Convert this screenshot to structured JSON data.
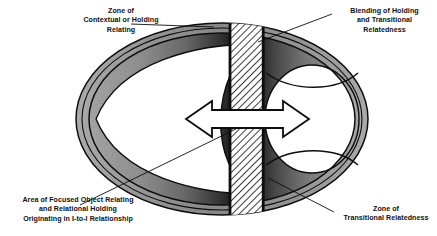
{
  "figure": {
    "type": "diagram",
    "labels": {
      "zone_contextual": {
        "name": "Zone of Contextual or Holding Relating",
        "lines": [
          "Zone of",
          "Contextual or Holding",
          "Relating"
        ],
        "align": "center"
      },
      "blending": {
        "name": "Blending of Holding and Transitional Relatedness",
        "lines": [
          "Blending of Holding",
          "and Transitional",
          "Relatedness"
        ],
        "align": "center"
      },
      "focused_object": {
        "name": "Area of Focused Object Relating and Relational Holding Originating in I-to-I Relationship",
        "lines": [
          "Area of Focused Object Relating",
          "and Relational Holding",
          "Originating in I-to-I Relationship"
        ],
        "align": "center"
      },
      "zone_transitional": {
        "name": "Zone of Transitional Relatedness",
        "lines": [
          "Zone of",
          "Transitional Relatedness"
        ],
        "align": "center"
      }
    },
    "elements": {
      "outer_ellipse": "outer-ellipse",
      "inner_ellipse": "inner-ellipse",
      "left_circle": "left-circle-region",
      "right_circle": "right-circle-region",
      "center_band": "hatched-center-band",
      "arrow": "double-headed-arrow"
    },
    "colors": {
      "ink": "#0d0d0d",
      "ring_light_gray": "#a9a9a9",
      "ring_mid_gray": "#8a8a8a",
      "ring_dark": "#2b2b2b",
      "ring_near_black": "#111111",
      "hatch_line": "#1a1a1a",
      "paper": "#ffffff"
    }
  }
}
